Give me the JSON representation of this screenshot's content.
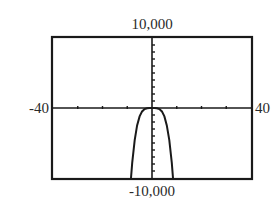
{
  "window": {
    "xmin": "-40",
    "xmax": "40",
    "ymin": "-10,000",
    "ymax": "10,000"
  },
  "colors": {
    "frame": "#1a1a1a",
    "curve": "#1a1a1a",
    "background": "#ffffff"
  },
  "chart_data": {
    "type": "line",
    "title": "",
    "xlabel": "",
    "ylabel": "",
    "xlim": [
      -40,
      40
    ],
    "ylim": [
      -10000,
      10000
    ],
    "xscl": 10,
    "yscl": 1000,
    "grid": false,
    "legend": null,
    "tick_labels": {
      "x": [
        "-40",
        "40"
      ],
      "y": [
        "-10,000",
        "10,000"
      ]
    },
    "series": [
      {
        "name": "curve",
        "x": [
          -8.5,
          -8,
          -7,
          -6,
          -5,
          -4,
          -3,
          -2,
          -1,
          0,
          1,
          2,
          3,
          4,
          5,
          6,
          7,
          8,
          8.5
        ],
        "values": [
          -10000,
          -7850,
          -4600,
          -2480,
          -1200,
          -490,
          -155,
          -30,
          -2,
          0,
          -2,
          -30,
          -155,
          -490,
          -1200,
          -2480,
          -4600,
          -7850,
          -10000
        ]
      }
    ]
  }
}
